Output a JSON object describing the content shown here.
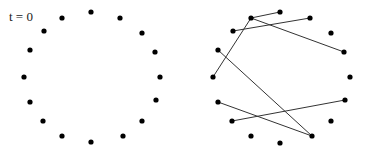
{
  "diagram": {
    "title": "t = 0",
    "node_color": "#000000",
    "edge_color": "#333333",
    "node_radius": 2.6,
    "panels": [
      {
        "name": "ring-no-edges",
        "nodes": [
          [
            91,
            12
          ],
          [
            120,
            18
          ],
          [
            142,
            33
          ],
          [
            155,
            52
          ],
          [
            160,
            77
          ],
          [
            156,
            100
          ],
          [
            142,
            121
          ],
          [
            123,
            136
          ],
          [
            91,
            142
          ],
          [
            62,
            136
          ],
          [
            43,
            121
          ],
          [
            30,
            102
          ],
          [
            24,
            77
          ],
          [
            30,
            50
          ],
          [
            44,
            31
          ],
          [
            62,
            18
          ]
        ],
        "edges": []
      },
      {
        "name": "ring-with-random-edges",
        "nodes": [
          [
            280,
            12
          ],
          [
            310,
            18
          ],
          [
            331,
            33
          ],
          [
            344,
            52
          ],
          [
            350,
            77
          ],
          [
            345,
            100
          ],
          [
            331,
            121
          ],
          [
            312,
            136
          ],
          [
            280,
            143
          ],
          [
            251,
            136
          ],
          [
            232,
            121
          ],
          [
            218,
            102
          ],
          [
            213,
            77
          ],
          [
            218,
            50
          ],
          [
            233,
            31
          ],
          [
            251,
            18
          ]
        ],
        "edges": [
          [
            15,
            0
          ],
          [
            15,
            12
          ],
          [
            15,
            3
          ],
          [
            14,
            1
          ],
          [
            13,
            7
          ],
          [
            11,
            7
          ],
          [
            10,
            5
          ]
        ]
      }
    ]
  }
}
